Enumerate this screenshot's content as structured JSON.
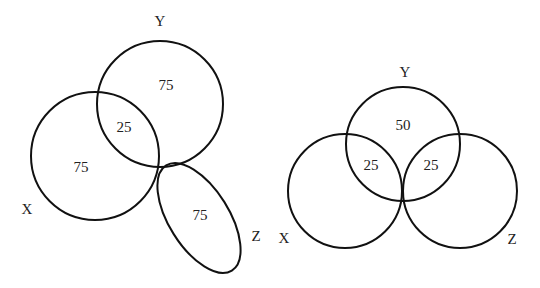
{
  "diagrams": [
    {
      "id": "left",
      "sets": [
        {
          "label": "X",
          "only": "75"
        },
        {
          "label": "Y",
          "only": "75"
        },
        {
          "label": "Z",
          "only": "75"
        }
      ],
      "intersections": [
        {
          "sets": "X∩Y",
          "value": "25"
        }
      ],
      "labels": {
        "x": "X",
        "y": "Y",
        "z": "Z"
      },
      "values": {
        "x_only": "75",
        "y_only": "75",
        "xy": "25",
        "z_only": "75"
      }
    },
    {
      "id": "right",
      "sets": [
        {
          "label": "X",
          "only": ""
        },
        {
          "label": "Y",
          "only": "50"
        },
        {
          "label": "Z",
          "only": ""
        }
      ],
      "intersections": [
        {
          "sets": "X∩Y",
          "value": "25"
        },
        {
          "sets": "Y∩Z",
          "value": "25"
        }
      ],
      "labels": {
        "x": "X",
        "y": "Y",
        "z": "Z"
      },
      "values": {
        "y_only": "50",
        "xy": "25",
        "yz": "25"
      }
    }
  ],
  "colors": {
    "stroke": "#111111",
    "text": "#222222",
    "background": "#ffffff"
  }
}
